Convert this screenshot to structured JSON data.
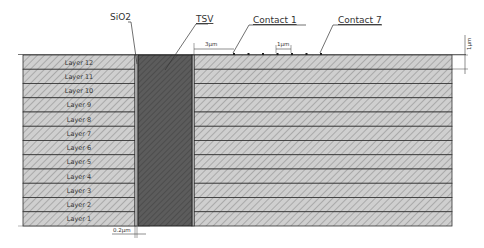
{
  "diagram": {
    "title_labels": {
      "sio2": "SiO2",
      "tsv": "TSV",
      "contact_first": "Contact 1",
      "contact_last": "Contact 7"
    },
    "dimensions": {
      "tsv_to_contact": "3µm",
      "contact_pitch": "1µm",
      "layer_thickness": "1µm",
      "sio2_thickness": "0.2µm"
    },
    "layers": [
      "Layer 12",
      "Layer 11",
      "Layer 10",
      "Layer 9",
      "Layer 8",
      "Layer 7",
      "Layer 6",
      "Layer 5",
      "Layer 4",
      "Layer 3",
      "Layer 2",
      "Layer 1"
    ],
    "contact_count": 7,
    "colors": {
      "layer_fill": "#c8c8c8",
      "tsv_fill": "#5a5a5a",
      "line": "#333333"
    }
  }
}
